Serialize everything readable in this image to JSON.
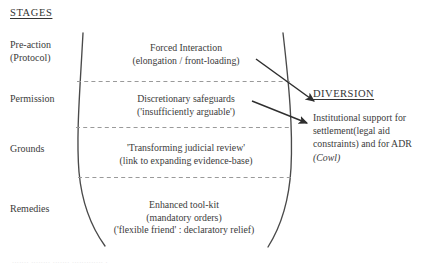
{
  "diagram": {
    "heading": "STAGES",
    "stages": [
      {
        "name": "pre-action",
        "label_line1": "Pre-action",
        "label_line2": "(Protocol)"
      },
      {
        "name": "permission",
        "label_line1": "Permission",
        "label_line2": ""
      },
      {
        "name": "grounds",
        "label_line1": "Grounds",
        "label_line2": ""
      },
      {
        "name": "remedies",
        "label_line1": "Remedies",
        "label_line2": ""
      }
    ],
    "bands": [
      {
        "name": "pre-action-band",
        "lines": [
          "Forced Interaction",
          "(elongation / front-loading)"
        ]
      },
      {
        "name": "permission-band",
        "lines": [
          "Discretionary safeguards",
          "('insufficiently arguable')"
        ]
      },
      {
        "name": "grounds-band",
        "lines": [
          "'Transforming judicial review'",
          "(link to expanding evidence-base)"
        ]
      },
      {
        "name": "remedies-band",
        "lines": [
          "Enhanced tool-kit",
          "(mandatory orders)",
          "('flexible friend' : declaratory relief)"
        ]
      }
    ],
    "diversion": {
      "heading": "DIVERSION",
      "body_lines": [
        "Institutional support for",
        "settlement(legal aid",
        "constraints) and for ADR"
      ],
      "body_italic_line": "(Cowl)"
    },
    "footer_ghost": "....... ........ ....... ............. .",
    "colors": {
      "ink": "#3a3a3a",
      "curve": "#4a4a4a",
      "dashed": "#9a9a9a",
      "arrow": "#2e2e2e",
      "background": "#ffffff"
    }
  }
}
